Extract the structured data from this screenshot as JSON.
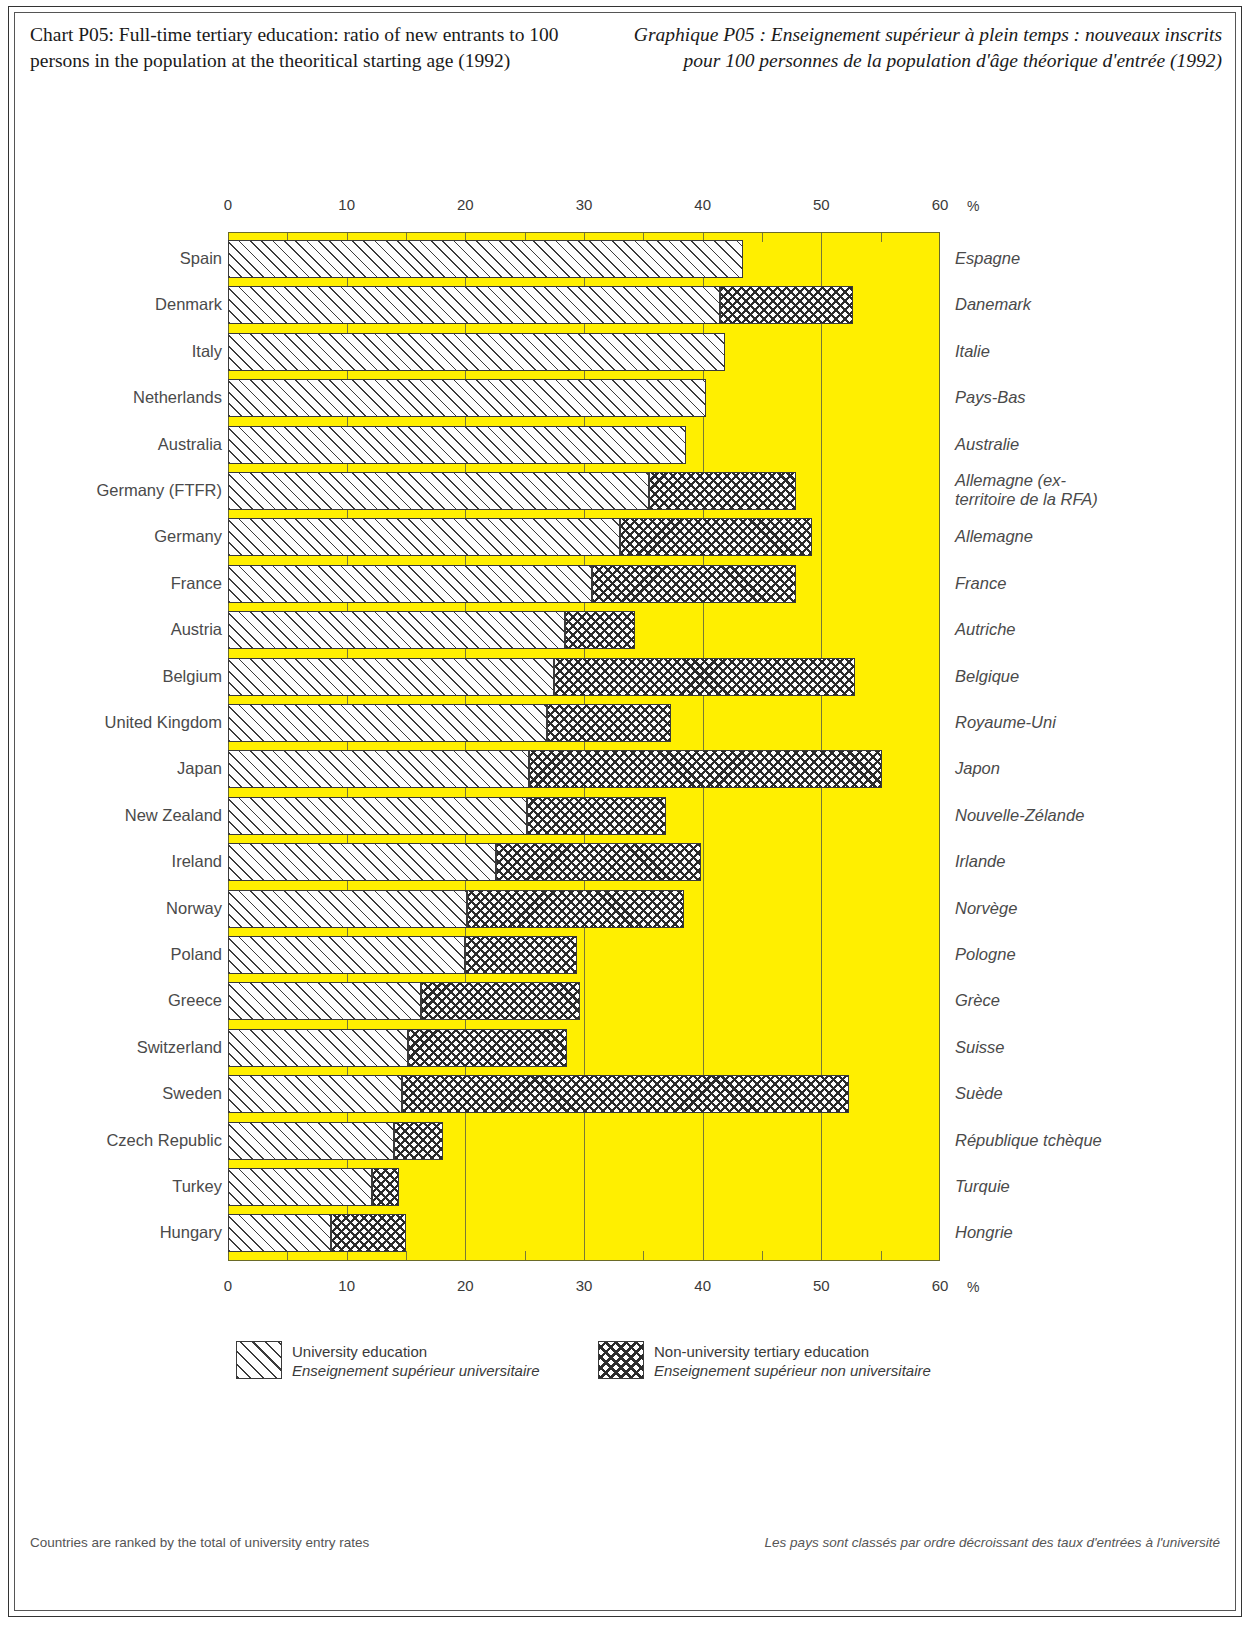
{
  "title_en": "Chart P05:\nFull-time tertiary education:\nratio of new entrants to 100 persons\nin the population at the theoritical\nstarting age (1992)",
  "title_fr": "Graphique P05 :\nEnseignement supérieur à plein temps :\nnouveaux inscrits pour 100 personnes\nde la population d'âge théorique\nd'entrée (1992)",
  "axis": {
    "unit": "%",
    "ticks": [
      "0",
      "10",
      "20",
      "30",
      "40",
      "50",
      "60"
    ]
  },
  "legend": {
    "univ_en": "University education",
    "univ_fr": "Enseignement supérieur universitaire",
    "nonuniv_en": "Non-university tertiary education",
    "nonuniv_fr": "Enseignement supérieur non universitaire"
  },
  "footnote_en": "Countries are ranked by the total\nof university entry rates",
  "footnote_fr": "Les pays sont classés par ordre décroissant\ndes taux d'entrées à l'université",
  "colors": {
    "plot_background": "#ffef00",
    "grid": "#7a7a35",
    "bar_outline": "#3a3a3a",
    "bar_fill": "#fdfdfd"
  },
  "chart_data": {
    "type": "bar",
    "orientation": "horizontal",
    "stacked": true,
    "title": "Full-time tertiary education: ratio of new entrants to 100 persons in the population at the theoritical starting age (1992)",
    "xlabel": "%",
    "ylabel": "",
    "xlim": [
      0,
      60
    ],
    "xticks": [
      0,
      10,
      20,
      30,
      40,
      50,
      60
    ],
    "minor_tick_interval": 5,
    "grid": true,
    "legend_position": "bottom",
    "categories": [
      "Spain",
      "Denmark",
      "Italy",
      "Netherlands",
      "Australia",
      "Germany (FTFR)",
      "Germany",
      "France",
      "Austria",
      "Belgium",
      "United Kingdom",
      "Japan",
      "New Zealand",
      "Ireland",
      "Norway",
      "Poland",
      "Greece",
      "Switzerland",
      "Sweden",
      "Czech Republic",
      "Turkey",
      "Hungary"
    ],
    "categories_fr": [
      "Espagne",
      "Danemark",
      "Italie",
      "Pays-Bas",
      "Australie",
      "Allemagne (ex-territoire de la RFA)",
      "Allemagne",
      "France",
      "Autriche",
      "Belgique",
      "Royaume-Uni",
      "Japon",
      "Nouvelle-Zélande",
      "Irlande",
      "Norvège",
      "Pologne",
      "Grèce",
      "Suisse",
      "Suède",
      "République tchèque",
      "Turquie",
      "Hongrie"
    ],
    "series": [
      {
        "name": "University education",
        "name_fr": "Enseignement supérieur universitaire",
        "values": [
          43.4,
          41.5,
          41.9,
          40.3,
          38.6,
          35.5,
          33.0,
          30.7,
          28.4,
          27.5,
          26.9,
          25.4,
          25.2,
          22.6,
          20.1,
          20.0,
          16.3,
          15.2,
          14.7,
          14.0,
          12.1,
          8.7
        ]
      },
      {
        "name": "Non-university tertiary education",
        "name_fr": "Enseignement supérieur non universitaire",
        "values": [
          0.0,
          11.2,
          0.0,
          0.0,
          0.0,
          12.4,
          16.2,
          17.2,
          5.9,
          25.3,
          10.4,
          29.7,
          11.7,
          17.3,
          18.3,
          9.4,
          13.4,
          13.4,
          37.6,
          4.1,
          2.3,
          6.3
        ]
      }
    ],
    "totals": [
      43.4,
      52.7,
      41.9,
      40.3,
      38.6,
      47.9,
      49.2,
      47.9,
      34.3,
      52.8,
      37.3,
      55.1,
      36.9,
      39.9,
      38.4,
      29.4,
      29.7,
      28.6,
      52.3,
      18.1,
      14.4,
      15.0
    ]
  }
}
